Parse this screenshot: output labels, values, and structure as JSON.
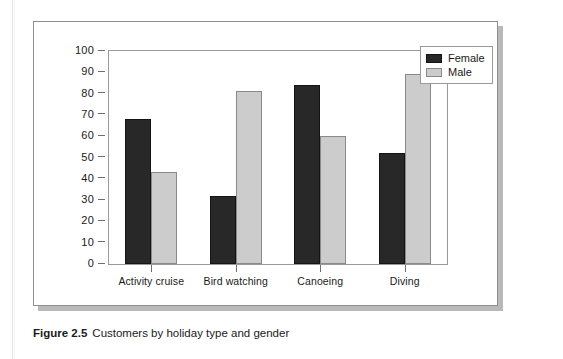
{
  "caption": {
    "label": "Figure 2.5",
    "text": "Customers by holiday type and gender"
  },
  "legend": {
    "items": [
      {
        "name": "Female",
        "color": "#282828"
      },
      {
        "name": "Male",
        "color": "#cccccc"
      }
    ]
  },
  "axes": {
    "y_ticks": [
      "100",
      "90",
      "80",
      "70",
      "60",
      "50",
      "40",
      "30",
      "20",
      "10",
      "0"
    ]
  },
  "chart_data": {
    "type": "bar",
    "title": "Customers by holiday type and gender",
    "xlabel": "",
    "ylabel": "",
    "ylim": [
      0,
      100
    ],
    "ytick_step": 10,
    "grid": false,
    "legend_position": "top-right",
    "categories": [
      "Activity cruise",
      "Bird watching",
      "Canoeing",
      "Diving"
    ],
    "series": [
      {
        "name": "Female",
        "color": "#282828",
        "values": [
          68,
          32,
          84,
          52
        ]
      },
      {
        "name": "Male",
        "color": "#cccccc",
        "values": [
          43,
          81,
          60,
          89
        ]
      }
    ]
  }
}
